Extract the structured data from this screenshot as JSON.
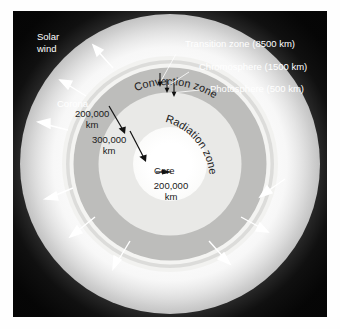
{
  "figure": {
    "background_color": "#050505",
    "panel": {
      "x": 13,
      "y": 11,
      "width": 314,
      "height": 306
    }
  },
  "labels": {
    "solar_wind": "Solar\nwind",
    "solar_wind_line1": "Solar",
    "solar_wind_line2": "wind",
    "corona": "Corona",
    "transition_zone": "Transition zone (8500 km)",
    "chromosphere": "Chromosphere (1500 km)",
    "photosphere": "Photosphere (500 km)",
    "convection_zone": "Convection zone",
    "radiation_zone": "Radiation zone",
    "core": "Core"
  },
  "dimensions": {
    "convection_thickness_value": "200,000",
    "convection_thickness_unit": "km",
    "radiation_thickness_value": "300,000",
    "radiation_thickness_unit": "km",
    "core_diameter_value": "200,000",
    "core_diameter_unit": "km"
  },
  "layers": [
    {
      "name": "corona",
      "label": "Corona",
      "thickness": null,
      "color": "#f7f7f7"
    },
    {
      "name": "transition",
      "label": "Transition zone",
      "thickness": "8500 km",
      "color": "#f4f4f2"
    },
    {
      "name": "chromosphere",
      "label": "Chromosphere",
      "thickness": "1500 km",
      "color": "#dcdcda"
    },
    {
      "name": "photosphere",
      "label": "Photosphere",
      "thickness": "500 km",
      "color": "#f2f2f0"
    },
    {
      "name": "convection",
      "label": "Convection zone",
      "thickness": "200,000 km",
      "color": "#bdbdbb"
    },
    {
      "name": "radiation",
      "label": "Radiation zone",
      "thickness": "300,000 km",
      "color": "#e9e9e7"
    },
    {
      "name": "core",
      "label": "Core",
      "thickness": "200,000 km",
      "color": "#ffffff"
    }
  ],
  "solar_wind_arrows": {
    "count": 9,
    "color": "#ffffff",
    "description": "white arrows radiating outward from the corona"
  }
}
